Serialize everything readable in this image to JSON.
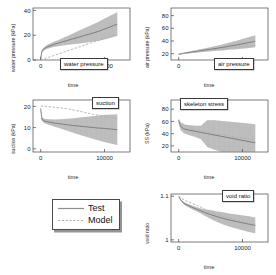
{
  "figure": {
    "legend": {
      "entries": [
        {
          "label": "Test",
          "style": "solid",
          "color": "#8a8a8a"
        },
        {
          "label": "Model",
          "style": "dashed",
          "color": "#a8a8a8"
        }
      ]
    }
  },
  "chart_data": [
    {
      "type": "line",
      "title": "water pressure",
      "xlabel": "time",
      "ylabel": "water pressure (kPa)",
      "xlim": [
        -1200,
        14000
      ],
      "ylim": [
        0,
        42
      ],
      "xticks": [
        0,
        10000
      ],
      "xticklabels": [
        "0",
        "10000"
      ],
      "yticks": [
        0,
        20,
        40
      ],
      "yticklabels": [
        "0",
        "20",
        "40"
      ],
      "grid": false,
      "series": [
        {
          "name": "Test",
          "color": "#8f8f8f",
          "description": "rises steeply from 0 to ~8 kPa near t=0, then grows roughly linearly to ~30 kPa at t=12000; oscillation band widens progressively after t~3000 reaching +/-9 kPa amplitude",
          "x": [
            0,
            200,
            500,
            1000,
            2000,
            3000,
            4000,
            5000,
            6000,
            7000,
            8000,
            9000,
            10000,
            11000,
            12000
          ],
          "mean": [
            1,
            7,
            9,
            10.5,
            12.5,
            14,
            15.5,
            17,
            18.5,
            20,
            21.5,
            23,
            25,
            27,
            29
          ],
          "band": [
            0.5,
            1.0,
            1.2,
            1.5,
            2.0,
            2.6,
            3.4,
            4.2,
            5.2,
            6.0,
            6.8,
            7.6,
            8.4,
            9.0,
            9.5
          ]
        },
        {
          "name": "Model",
          "color": "#b0b0b0",
          "description": "near zero at t=0 and increases almost linearly to ~21 kPa at t=12000",
          "x": [
            0,
            2000,
            4000,
            6000,
            8000,
            10000,
            12000
          ],
          "mean": [
            0,
            3.5,
            7,
            10.5,
            14,
            17.5,
            21
          ]
        }
      ]
    },
    {
      "type": "line",
      "title": "air pressure",
      "xlabel": "time",
      "ylabel": "air pressure (kPa)",
      "xlim": [
        -1200,
        14000
      ],
      "ylim": [
        10,
        92
      ],
      "xticks": [
        0,
        10000
      ],
      "xticklabels": [
        "0",
        "10000"
      ],
      "yticks": [
        20,
        40,
        60,
        80
      ],
      "yticklabels": [
        "20",
        "40",
        "60",
        "80"
      ],
      "grid": false,
      "series": [
        {
          "name": "Test",
          "color": "#8f8f8f",
          "description": "starts near 19 kPa, increases gradually to ~40 kPa at t=12000 with oscillation band widening to about +/-9 kPa",
          "x": [
            0,
            500,
            1000,
            2000,
            3000,
            4000,
            5000,
            6000,
            7000,
            8000,
            9000,
            10000,
            11000,
            12000
          ],
          "mean": [
            19,
            20,
            21,
            22.5,
            24,
            25.5,
            27,
            28.5,
            30,
            32,
            33.5,
            35.5,
            37.5,
            39.5
          ],
          "band": [
            0.6,
            0.9,
            1.1,
            1.5,
            2.0,
            2.6,
            3.2,
            4.0,
            4.8,
            5.6,
            6.6,
            7.6,
            8.6,
            9.4
          ]
        },
        {
          "name": "Model",
          "color": "#b0b0b0",
          "description": "tracks close to the test mean, rising from 19 kPa to about 33 kPa",
          "x": [
            0,
            2000,
            4000,
            6000,
            8000,
            10000,
            12000
          ],
          "mean": [
            19,
            21.5,
            24,
            26.5,
            28.5,
            31,
            33
          ]
        }
      ]
    },
    {
      "type": "line",
      "title": "suction",
      "xlabel": "time",
      "ylabel": "suction (kPa)",
      "xlim": [
        -1200,
        14000
      ],
      "ylim": [
        -1.5,
        23
      ],
      "xticks": [
        0,
        10000
      ],
      "xticklabels": [
        "0",
        "10000"
      ],
      "yticks": [
        0,
        10,
        20
      ],
      "yticklabels": [
        "0",
        "10",
        "20"
      ],
      "grid": false,
      "series": [
        {
          "name": "Test",
          "color": "#8f8f8f",
          "description": "drops sharply from ~19 kPa to ~13 kPa near t=0 then decays slowly to ~9 kPa by t=12000 with oscillation band widening to about +/-7 kPa",
          "x": [
            0,
            200,
            500,
            1000,
            2000,
            3000,
            4000,
            5000,
            6000,
            7000,
            8000,
            9000,
            10000,
            11000,
            12000
          ],
          "mean": [
            19,
            14,
            13.2,
            12.8,
            12.2,
            11.8,
            11.4,
            11.0,
            10.7,
            10.4,
            10.1,
            9.8,
            9.6,
            9.3,
            9.0
          ],
          "band": [
            0.4,
            0.8,
            1.0,
            1.2,
            1.6,
            2.1,
            2.7,
            3.3,
            4.0,
            4.6,
            5.2,
            5.8,
            6.4,
            6.8,
            7.2
          ]
        },
        {
          "name": "Model",
          "color": "#b0b0b0",
          "description": "starts at about 20 kPa, declines gently to ~19 kPa by t=4000 then falls to ~14 kPa at t=12000",
          "x": [
            0,
            2000,
            4000,
            6000,
            8000,
            10000,
            12000
          ],
          "mean": [
            20.2,
            19.6,
            19.0,
            17.8,
            16.4,
            15.2,
            14.2
          ]
        }
      ]
    },
    {
      "type": "line",
      "title": "skeleton stress",
      "xlabel": "time",
      "ylabel": "SS (kPa)",
      "xlim": [
        -1200,
        14000
      ],
      "ylim": [
        10,
        95
      ],
      "xticks": [
        0,
        10000
      ],
      "xticklabels": [
        "0",
        "10000"
      ],
      "yticks": [
        20,
        40,
        60,
        80
      ],
      "yticklabels": [
        "20",
        "40",
        "60",
        "80"
      ],
      "grid": false,
      "series": [
        {
          "name": "Test",
          "color": "#8f8f8f",
          "description": "falls from ~62 kPa at t=0 to ~45 kPa by t=2000 then declines to ~25 kPa at t=12000; oscillation band widens steeply after t=4000 reaching the top of the axis near 88 kPa",
          "x": [
            0,
            300,
            800,
            1500,
            2500,
            3500,
            4500,
            5500,
            6500,
            7500,
            8500,
            9500,
            10500,
            11500,
            12000
          ],
          "mean": [
            62,
            52,
            48,
            46,
            44,
            42,
            40,
            38,
            36,
            34,
            32,
            30,
            28,
            26,
            25
          ],
          "band": [
            3,
            6,
            7,
            8,
            9,
            11,
            22,
            24,
            25,
            26,
            27,
            28,
            29,
            30,
            30
          ]
        },
        {
          "name": "Model",
          "color": "#b0b0b0",
          "description": "declines smoothly from ~60 kPa to ~30 kPa",
          "x": [
            0,
            2000,
            4000,
            6000,
            8000,
            10000,
            12000
          ],
          "mean": [
            60,
            48,
            43,
            39,
            36,
            33,
            30
          ]
        }
      ]
    },
    {
      "type": "line",
      "title": "void ratio",
      "xlabel": "time",
      "ylabel": "void ratio",
      "xlim": [
        -1200,
        14000
      ],
      "ylim": [
        0.995,
        1.105
      ],
      "xticks": [
        0,
        10000
      ],
      "xticklabels": [
        "0",
        "10000"
      ],
      "yticks": [
        1,
        1.1
      ],
      "yticklabels": [
        "1",
        "1.1"
      ],
      "grid": false,
      "series": [
        {
          "name": "Test",
          "color": "#8f8f8f",
          "description": "decreases from 1.10 at t=0 down to about 1.03 at t=12000 with oscillation band widening after t=4000 to roughly +/-0.018",
          "x": [
            0,
            500,
            1000,
            2000,
            3000,
            4000,
            5000,
            6000,
            7000,
            8000,
            9000,
            10000,
            11000,
            12000
          ],
          "mean": [
            1.099,
            1.088,
            1.082,
            1.075,
            1.069,
            1.063,
            1.058,
            1.053,
            1.049,
            1.045,
            1.042,
            1.039,
            1.036,
            1.033
          ],
          "band": [
            0.001,
            0.002,
            0.003,
            0.004,
            0.005,
            0.007,
            0.01,
            0.012,
            0.014,
            0.015,
            0.016,
            0.017,
            0.018,
            0.018
          ]
        },
        {
          "name": "Model",
          "color": "#b0b0b0",
          "description": "starts at 1.10 and decreases smoothly, slightly above the test trace until t=4000, ending near 1.035",
          "x": [
            0,
            1000,
            2000,
            3000,
            4000,
            6000,
            8000,
            10000,
            12000
          ],
          "mean": [
            1.1,
            1.09,
            1.084,
            1.078,
            1.071,
            1.058,
            1.049,
            1.042,
            1.035
          ]
        }
      ]
    }
  ]
}
